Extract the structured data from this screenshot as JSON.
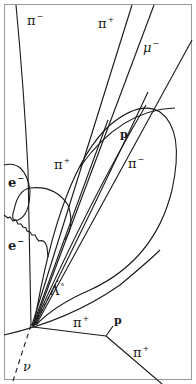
{
  "diagram": {
    "type": "bubble-chamber-event",
    "colors": {
      "track": "#1a1a1a",
      "frame": "#9a9a9a",
      "background": "#ffffff"
    },
    "labels": {
      "pi_minus_top": {
        "base": "π",
        "charge": "−"
      },
      "pi_plus_top": {
        "base": "π",
        "charge": "+"
      },
      "mu_minus": {
        "base": "μ",
        "charge": "−"
      },
      "p_upper": {
        "base": "p",
        "charge": ""
      },
      "pi_plus_mid": {
        "base": "π",
        "charge": "+"
      },
      "pi_minus_mid": {
        "base": "π",
        "charge": "−"
      },
      "e_minus_upper": {
        "base": "e",
        "charge": "−"
      },
      "e_minus_lower": {
        "base": "e",
        "charge": "−"
      },
      "lambda0": {
        "base": "Λ",
        "charge": "°"
      },
      "pi_plus_low": {
        "base": "π",
        "charge": "+"
      },
      "p_low": {
        "base": "p",
        "charge": ""
      },
      "pi_plus_bottom": {
        "base": "π",
        "charge": "+"
      },
      "nu": {
        "base": "ν",
        "charge": ""
      }
    }
  }
}
